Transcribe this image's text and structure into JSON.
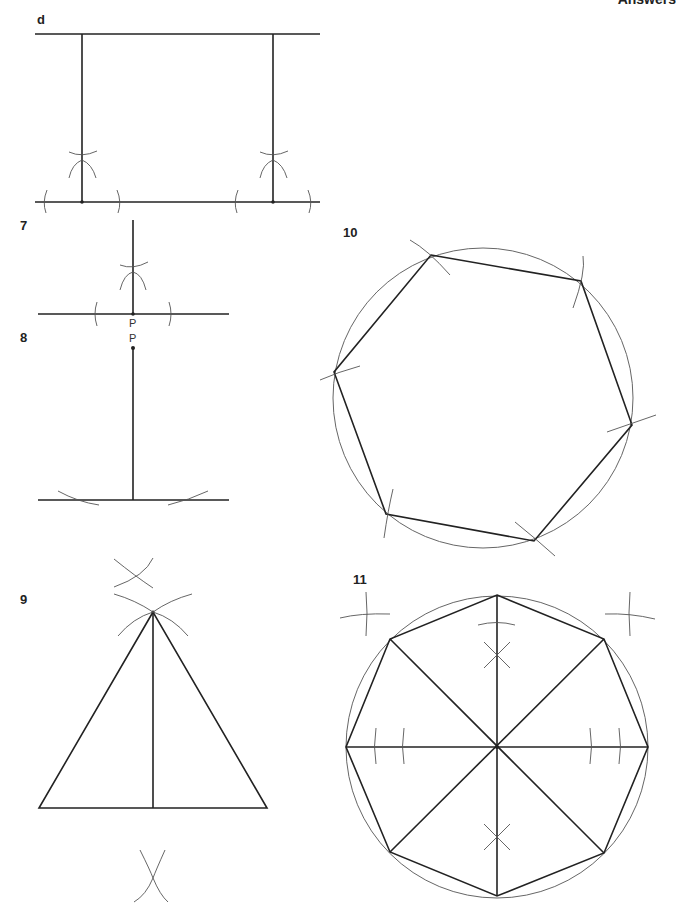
{
  "header": {
    "title": "Answers"
  },
  "figures": {
    "d": {
      "label": "d",
      "description": "Two perpendiculars between parallel lines"
    },
    "q7": {
      "label": "7",
      "point_label": "P",
      "description": "Perpendicular at point P on a line"
    },
    "q8": {
      "label": "8",
      "point_label": "P",
      "description": "Perpendicular from point P to a line"
    },
    "q9": {
      "label": "9",
      "description": "Isosceles triangle with perpendicular bisector"
    },
    "q10": {
      "label": "10",
      "description": "Regular hexagon inscribed in circle"
    },
    "q11": {
      "label": "11",
      "description": "Regular octagon inscribed in circle"
    }
  },
  "colors": {
    "line": "#222222",
    "construction": "#555555",
    "background": "#ffffff"
  }
}
